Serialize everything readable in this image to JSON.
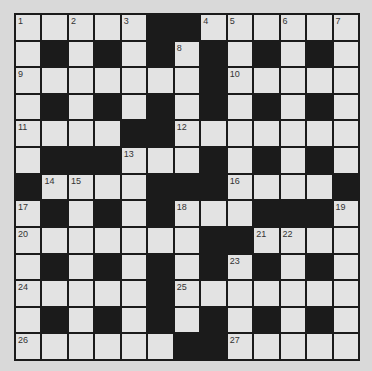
{
  "puzzle": {
    "title_fragment": "",
    "size": {
      "rows": 13,
      "cols": 13
    },
    "colors": {
      "white_cell": "#e3e3e3",
      "black_cell": "#1b1b1b",
      "background": "#d9d9d9"
    },
    "grid": [
      "WWWWWBBWWWWWW",
      "WBWBWBWBWBWBW",
      "WWWWWWWBWWWWW",
      "WBWBWBWBWBWBW",
      "WWWWBBWWWWWWW",
      "WBBBWWWBWBWBW",
      "BWWWWBBBWWWWB",
      "WBWBWBWWWBBBW",
      "WWWWWWWBBWWWW",
      "WBWBWBWBWBWBW",
      "WWWWWBWWWWWWW",
      "WBWBWBWBWBWBW",
      "WWWWWWBBWWWWW"
    ],
    "numbers": [
      {
        "n": "1",
        "r": 0,
        "c": 0
      },
      {
        "n": "2",
        "r": 0,
        "c": 2
      },
      {
        "n": "3",
        "r": 0,
        "c": 4
      },
      {
        "n": "4",
        "r": 0,
        "c": 7
      },
      {
        "n": "5",
        "r": 0,
        "c": 8
      },
      {
        "n": "6",
        "r": 0,
        "c": 10
      },
      {
        "n": "7",
        "r": 0,
        "c": 12
      },
      {
        "n": "8",
        "r": 1,
        "c": 6
      },
      {
        "n": "9",
        "r": 2,
        "c": 0
      },
      {
        "n": "10",
        "r": 2,
        "c": 8
      },
      {
        "n": "11",
        "r": 4,
        "c": 0
      },
      {
        "n": "12",
        "r": 4,
        "c": 6
      },
      {
        "n": "13",
        "r": 5,
        "c": 4
      },
      {
        "n": "14",
        "r": 6,
        "c": 1
      },
      {
        "n": "15",
        "r": 6,
        "c": 2
      },
      {
        "n": "16",
        "r": 6,
        "c": 8
      },
      {
        "n": "17",
        "r": 7,
        "c": 0
      },
      {
        "n": "18",
        "r": 7,
        "c": 6
      },
      {
        "n": "19",
        "r": 7,
        "c": 12
      },
      {
        "n": "20",
        "r": 8,
        "c": 0
      },
      {
        "n": "21",
        "r": 8,
        "c": 9
      },
      {
        "n": "22",
        "r": 8,
        "c": 10
      },
      {
        "n": "23",
        "r": 9,
        "c": 8
      },
      {
        "n": "24",
        "r": 10,
        "c": 0
      },
      {
        "n": "25",
        "r": 10,
        "c": 6
      },
      {
        "n": "26",
        "r": 12,
        "c": 0
      },
      {
        "n": "27",
        "r": 12,
        "c": 8
      }
    ]
  }
}
